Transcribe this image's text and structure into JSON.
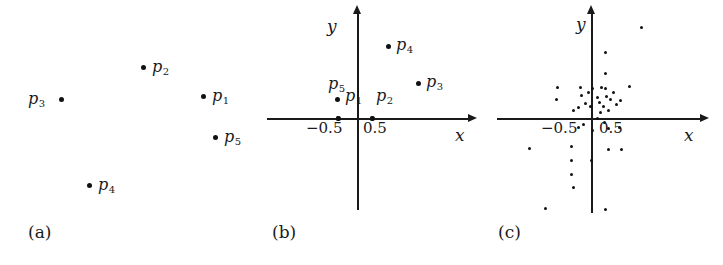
{
  "figure": {
    "width": 723,
    "height": 265,
    "background": "#ffffff",
    "ink": "#1a1a1a"
  },
  "chart_data": [
    {
      "type": "scatter",
      "panel": "a",
      "panel_label": "(a)",
      "title": "",
      "xlabel": "",
      "ylabel": "",
      "axes_shown": false,
      "grid": false,
      "legend": "none",
      "point_labels": [
        "p1",
        "p2",
        "p3",
        "p4",
        "p5"
      ],
      "points": [
        {
          "label": "p1",
          "label_text": "p",
          "label_sub": "1",
          "px": 203,
          "py": 96,
          "label_px": 212,
          "label_py": 88
        },
        {
          "label": "p2",
          "label_text": "p",
          "label_sub": "2",
          "px": 143,
          "py": 67,
          "label_px": 152,
          "label_py": 59
        },
        {
          "label": "p3",
          "label_text": "p",
          "label_sub": "3",
          "px": 61,
          "py": 99,
          "label_px": 28,
          "label_py": 91
        },
        {
          "label": "p4",
          "label_text": "p",
          "label_sub": "4",
          "px": 89,
          "py": 185,
          "label_px": 98,
          "label_py": 177
        },
        {
          "label": "p5",
          "label_text": "p",
          "label_sub": "5",
          "px": 215,
          "py": 137,
          "label_px": 224,
          "label_py": 129
        }
      ]
    },
    {
      "type": "scatter",
      "panel": "b",
      "panel_label": "(b)",
      "title": "",
      "xlabel": "x",
      "ylabel": "y",
      "axes_shown": true,
      "grid": false,
      "legend": "none",
      "x_tick_labels": [
        "-0.5",
        "0.5"
      ],
      "x_tick_px": [
        338,
        372
      ],
      "y_axis_px": 357,
      "x_axis_py": 118,
      "x_axis_from": 267,
      "x_axis_to": 468,
      "y_axis_from": 14,
      "y_axis_to": 210,
      "xlabel_px": 455,
      "xlabel_py": 127,
      "ylabel_px": 327,
      "ylabel_py": 18,
      "tick_label_py": 121,
      "point_labels": [
        "p1",
        "p2",
        "p3",
        "p4",
        "p5"
      ],
      "points": [
        {
          "label": "p1",
          "label_text": "p",
          "label_sub": "1",
          "px": 338,
          "py": 118,
          "label_px": 345,
          "label_py": 88
        },
        {
          "label": "p2",
          "label_text": "p",
          "label_sub": "2",
          "px": 372,
          "py": 118,
          "label_px": 376,
          "label_py": 88
        },
        {
          "label": "p3",
          "label_text": "p",
          "label_sub": "3",
          "px": 418,
          "py": 83,
          "label_px": 426,
          "label_py": 74
        },
        {
          "label": "p4",
          "label_text": "p",
          "label_sub": "4",
          "px": 388,
          "py": 46,
          "label_px": 396,
          "label_py": 37
        },
        {
          "label": "p5",
          "label_text": "p",
          "label_sub": "5",
          "px": 337,
          "py": 99,
          "label_px": 328,
          "label_py": 76
        }
      ]
    },
    {
      "type": "scatter",
      "panel": "c",
      "panel_label": "(c)",
      "title": "",
      "xlabel": "x",
      "ylabel": "y",
      "axes_shown": true,
      "grid": false,
      "legend": "none",
      "x_tick_labels": [
        "-0.5",
        "0.5"
      ],
      "x_tick_px": [
        573,
        608
      ],
      "y_axis_px": 591,
      "x_axis_py": 118,
      "x_axis_from": 497,
      "x_axis_to": 700,
      "y_axis_from": 14,
      "y_axis_to": 213,
      "xlabel_px": 684,
      "xlabel_py": 127,
      "ylabel_px": 576,
      "ylabel_py": 16,
      "tick_label_py": 121,
      "n_points": 45,
      "points_px": [
        [
          641,
          27
        ],
        [
          605,
          52
        ],
        [
          605,
          73
        ],
        [
          605,
          88
        ],
        [
          629,
          86
        ],
        [
          557,
          87
        ],
        [
          580,
          87
        ],
        [
          601,
          87
        ],
        [
          556,
          99
        ],
        [
          581,
          95
        ],
        [
          588,
          92
        ],
        [
          592,
          88
        ],
        [
          597,
          97
        ],
        [
          599,
          102
        ],
        [
          585,
          103
        ],
        [
          590,
          106
        ],
        [
          578,
          107
        ],
        [
          606,
          96
        ],
        [
          610,
          99
        ],
        [
          613,
          92
        ],
        [
          616,
          104
        ],
        [
          620,
          100
        ],
        [
          603,
          106
        ],
        [
          573,
          110
        ],
        [
          608,
          110
        ],
        [
          600,
          112
        ],
        [
          597,
          118
        ],
        [
          604,
          122
        ],
        [
          583,
          124
        ],
        [
          578,
          127
        ],
        [
          592,
          130
        ],
        [
          608,
          128
        ],
        [
          619,
          127
        ],
        [
          529,
          148
        ],
        [
          571,
          146
        ],
        [
          608,
          149
        ],
        [
          621,
          149
        ],
        [
          571,
          160
        ],
        [
          591,
          160
        ],
        [
          571,
          174
        ],
        [
          573,
          187
        ],
        [
          545,
          208
        ],
        [
          605,
          209
        ]
      ]
    }
  ],
  "panel_labels": [
    {
      "text": "(a)",
      "px": 28,
      "py": 222
    },
    {
      "text": "(b)",
      "px": 272,
      "py": 222
    },
    {
      "text": "(c)",
      "px": 498,
      "py": 222
    }
  ]
}
